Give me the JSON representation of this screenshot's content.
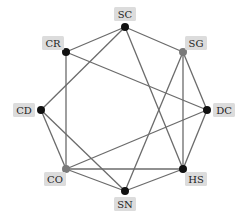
{
  "diagram": {
    "type": "network-graph",
    "layout": "circular",
    "colors": {
      "edge": "#6b6b6b",
      "node_default": "#111111",
      "node_gray": "#7a7a7a",
      "label_bg": "#dcdcdc",
      "label_text": "#222222"
    },
    "nodes": [
      {
        "id": "SC",
        "label": "SC",
        "x": 125,
        "y": 27,
        "color": "#111111",
        "lx": 125,
        "ly": 14,
        "lw": 22
      },
      {
        "id": "SG",
        "label": "SG",
        "x": 183,
        "y": 52,
        "color": "#7a7a7a",
        "lx": 196,
        "ly": 43,
        "lw": 22
      },
      {
        "id": "DC",
        "label": "DC",
        "x": 207,
        "y": 110,
        "color": "#111111",
        "lx": 224,
        "ly": 110,
        "lw": 22
      },
      {
        "id": "HS",
        "label": "HS",
        "x": 183,
        "y": 169,
        "color": "#111111",
        "lx": 196,
        "ly": 179,
        "lw": 22
      },
      {
        "id": "SN",
        "label": "SN",
        "x": 125,
        "y": 191,
        "color": "#111111",
        "lx": 125,
        "ly": 204,
        "lw": 22
      },
      {
        "id": "CO",
        "label": "CO",
        "x": 66,
        "y": 169,
        "color": "#7a7a7a",
        "lx": 55,
        "ly": 179,
        "lw": 22
      },
      {
        "id": "CD",
        "label": "CD",
        "x": 41,
        "y": 110,
        "color": "#111111",
        "lx": 24,
        "ly": 110,
        "lw": 22
      },
      {
        "id": "CR",
        "label": "CR",
        "x": 66,
        "y": 52,
        "color": "#111111",
        "lx": 53,
        "ly": 43,
        "lw": 22
      }
    ],
    "edges": [
      [
        "SC",
        "CR"
      ],
      [
        "SC",
        "SG"
      ],
      [
        "SC",
        "CD"
      ],
      [
        "SC",
        "HS"
      ],
      [
        "CR",
        "CO"
      ],
      [
        "CR",
        "DC"
      ],
      [
        "SG",
        "SN"
      ],
      [
        "SG",
        "HS"
      ],
      [
        "SG",
        "DC"
      ],
      [
        "DC",
        "HS"
      ],
      [
        "DC",
        "CO"
      ],
      [
        "CD",
        "CO"
      ],
      [
        "CD",
        "SN"
      ],
      [
        "CO",
        "HS"
      ],
      [
        "CO",
        "SN"
      ],
      [
        "SN",
        "HS"
      ]
    ]
  }
}
